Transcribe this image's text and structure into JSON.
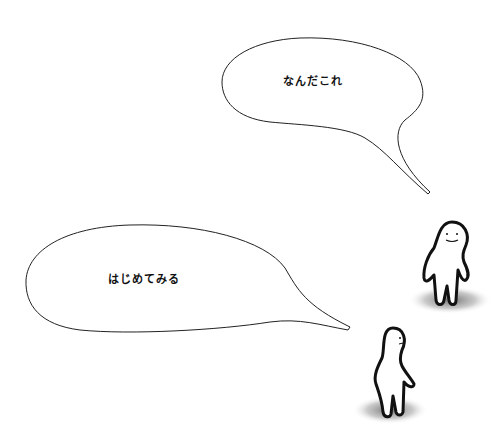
{
  "scene": {
    "description": "Illustration with two simple white figures and two speech bubbles",
    "background": "#ffffff",
    "line_color": "#222222"
  },
  "bubbles": [
    {
      "id": "upper",
      "text": "なんだこれ"
    },
    {
      "id": "lower",
      "text": "はじめてみる"
    }
  ],
  "characters": [
    {
      "id": "right-figure",
      "expression": "smile"
    },
    {
      "id": "lower-figure",
      "expression": "side-view"
    }
  ]
}
